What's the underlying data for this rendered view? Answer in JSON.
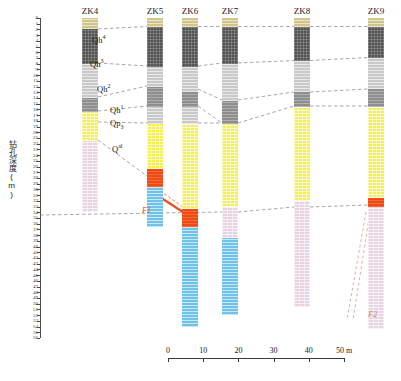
{
  "figure": {
    "type": "geological-borehole-cross-section",
    "y_axis": {
      "label": "钻孔深度(m)",
      "unit": "m",
      "min": 0,
      "max": 56,
      "tick_step": 1,
      "major_step": 5,
      "ticks": [
        0,
        1,
        2,
        3,
        4,
        5,
        6,
        7,
        8,
        9,
        10,
        11,
        12,
        13,
        14,
        15,
        16,
        17,
        18,
        19,
        20,
        21,
        22,
        23,
        24,
        25,
        26,
        27,
        28,
        29,
        30,
        31,
        32,
        33,
        34,
        35,
        36,
        37,
        38,
        39,
        40,
        41,
        42,
        43,
        44,
        45,
        46,
        47,
        48,
        49,
        50,
        51,
        52,
        53,
        54,
        55,
        56
      ]
    },
    "scale_bar": {
      "ticks": [
        0,
        10,
        20,
        30,
        40,
        50
      ],
      "labels": [
        "0",
        "10",
        "20",
        "30",
        "40",
        "50 m"
      ],
      "unit": "m",
      "total": 50
    },
    "legend_colors": {
      "qh4_olive": "#cfc58a",
      "qh3_dark_gray": "#545454",
      "qh2_light_gray": "#c9c9c9",
      "qh1_medium_gray": "#8e8e8e",
      "qp3_yellow": "#f4ee4f",
      "qal_pink": "#e8d3e2",
      "bedrock_blue": "#6ec2e8",
      "fault_orange": "#f04a12"
    },
    "layer_labels": [
      {
        "name": "Qh4",
        "text": "Qh",
        "sup": "4",
        "sub": "",
        "x": 92,
        "y": 34
      },
      {
        "name": "Qh3",
        "text": "Qh",
        "sup": "3",
        "sub": "",
        "x": 90,
        "y": 58
      },
      {
        "name": "Qh2",
        "text": "Qh",
        "sup": "2",
        "sub": "",
        "x": 97,
        "y": 83
      },
      {
        "name": "Qh1",
        "text": "Qh",
        "sup": "1",
        "sub": "",
        "x": 110,
        "y": 104
      },
      {
        "name": "Qp3",
        "text": "Qp",
        "sup": "",
        "sub": "3",
        "x": 110,
        "y": 118
      },
      {
        "name": "Qal",
        "text": "Q",
        "sup": "al",
        "sub": "",
        "x": 112,
        "y": 143
      }
    ],
    "fault_labels": [
      {
        "name": "F1",
        "text": "F1",
        "x": 142,
        "y": 206
      },
      {
        "name": "F2",
        "text": "F2",
        "x": 368,
        "y": 310
      }
    ]
  },
  "boreholes": [
    {
      "id": "ZK4",
      "x": 82,
      "width": 16,
      "top": 18,
      "segments": [
        {
          "unit": "Qh4",
          "tex": "tex-olive",
          "from": 0.0,
          "to": 2.0
        },
        {
          "unit": "Qh3",
          "tex": "tex-dkgray",
          "from": 2.0,
          "to": 8.0
        },
        {
          "unit": "Qh2",
          "tex": "tex-ltgray",
          "from": 8.0,
          "to": 14.0
        },
        {
          "unit": "Qh1",
          "tex": "tex-mdgray",
          "from": 14.0,
          "to": 16.5
        },
        {
          "unit": "Qp3",
          "tex": "tex-yellow",
          "from": 16.5,
          "to": 21.5
        },
        {
          "unit": "Qal",
          "tex": "tex-pink",
          "from": 21.5,
          "to": 34.0
        }
      ]
    },
    {
      "id": "ZK5",
      "x": 147,
      "width": 16,
      "top": 18,
      "segments": [
        {
          "unit": "Qh4",
          "tex": "tex-olive",
          "from": 0.0,
          "to": 1.5
        },
        {
          "unit": "Qh3",
          "tex": "tex-dkgray",
          "from": 1.5,
          "to": 8.5
        },
        {
          "unit": "Qh2",
          "tex": "tex-ltgray",
          "from": 8.5,
          "to": 12.0
        },
        {
          "unit": "Qh1",
          "tex": "tex-mdgray",
          "from": 12.0,
          "to": 15.5
        },
        {
          "unit": "Qp3",
          "tex": "tex-ltgray",
          "from": 15.5,
          "to": 18.5
        },
        {
          "unit": "Qal",
          "tex": "tex-yellow",
          "from": 18.5,
          "to": 26.5
        },
        {
          "unit": "F1",
          "tex": "tex-orange",
          "from": 26.5,
          "to": 29.5
        },
        {
          "unit": "Bed",
          "tex": "tex-blue",
          "from": 29.5,
          "to": 36.5
        }
      ]
    },
    {
      "id": "ZK6",
      "x": 182,
      "width": 16,
      "top": 18,
      "segments": [
        {
          "unit": "Qh4",
          "tex": "tex-olive",
          "from": 0.0,
          "to": 1.5
        },
        {
          "unit": "Qh3",
          "tex": "tex-dkgray",
          "from": 1.5,
          "to": 8.5
        },
        {
          "unit": "Qh2",
          "tex": "tex-ltgray",
          "from": 8.5,
          "to": 13.0
        },
        {
          "unit": "Qh1",
          "tex": "tex-mdgray",
          "from": 13.0,
          "to": 15.5
        },
        {
          "unit": "Qp3",
          "tex": "tex-ltgray",
          "from": 15.5,
          "to": 18.5
        },
        {
          "unit": "Qal",
          "tex": "tex-yellow",
          "from": 18.5,
          "to": 33.5
        },
        {
          "unit": "F1",
          "tex": "tex-orange",
          "from": 33.5,
          "to": 36.5
        },
        {
          "unit": "Bed",
          "tex": "tex-blue",
          "from": 36.5,
          "to": 54.0
        }
      ]
    },
    {
      "id": "ZK7",
      "x": 222,
      "width": 16,
      "top": 18,
      "segments": [
        {
          "unit": "Qh4",
          "tex": "tex-olive",
          "from": 0.0,
          "to": 1.5
        },
        {
          "unit": "Qh3",
          "tex": "tex-dkgray",
          "from": 1.5,
          "to": 8.0
        },
        {
          "unit": "Qh2",
          "tex": "tex-ltgray",
          "from": 8.0,
          "to": 14.5
        },
        {
          "unit": "Qh1",
          "tex": "tex-mdgray",
          "from": 14.5,
          "to": 18.5
        },
        {
          "unit": "Qp3",
          "tex": "tex-yellow",
          "from": 18.5,
          "to": 33.0
        },
        {
          "unit": "Qal",
          "tex": "tex-pink",
          "from": 33.0,
          "to": 38.5
        },
        {
          "unit": "Bed",
          "tex": "tex-blue",
          "from": 38.5,
          "to": 52.0
        }
      ]
    },
    {
      "id": "ZK8",
      "x": 294,
      "width": 16,
      "top": 18,
      "segments": [
        {
          "unit": "Qh4",
          "tex": "tex-olive",
          "from": 0.0,
          "to": 1.5
        },
        {
          "unit": "Qh3",
          "tex": "tex-dkgray",
          "from": 1.5,
          "to": 7.5
        },
        {
          "unit": "Qh2",
          "tex": "tex-ltgray",
          "from": 7.5,
          "to": 13.0
        },
        {
          "unit": "Qh1",
          "tex": "tex-mdgray",
          "from": 13.0,
          "to": 15.5
        },
        {
          "unit": "Qp3",
          "tex": "tex-yellow",
          "from": 15.5,
          "to": 32.0
        },
        {
          "unit": "Qal",
          "tex": "tex-pink",
          "from": 32.0,
          "to": 50.5
        }
      ]
    },
    {
      "id": "ZK9",
      "x": 368,
      "width": 16,
      "top": 18,
      "segments": [
        {
          "unit": "Qh4",
          "tex": "tex-olive",
          "from": 0.0,
          "to": 1.5
        },
        {
          "unit": "Qh3",
          "tex": "tex-dkgray",
          "from": 1.5,
          "to": 7.0
        },
        {
          "unit": "Qh2",
          "tex": "tex-ltgray",
          "from": 7.0,
          "to": 12.5
        },
        {
          "unit": "Qh1",
          "tex": "tex-mdgray",
          "from": 12.5,
          "to": 15.5
        },
        {
          "unit": "Qp3",
          "tex": "tex-yellow",
          "from": 15.5,
          "to": 31.5
        },
        {
          "unit": "F2",
          "tex": "tex-orange",
          "from": 31.5,
          "to": 33.0
        },
        {
          "unit": "Qal",
          "tex": "tex-pink",
          "from": 33.0,
          "to": 54.5
        }
      ]
    }
  ]
}
